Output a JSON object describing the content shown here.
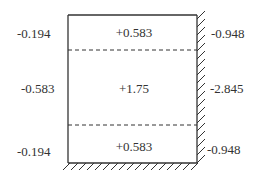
{
  "diagram": {
    "type": "structural-section-moment-distribution",
    "zones": [
      {
        "id": "top",
        "inner_value": "+0.583",
        "left_value": "-0.194",
        "right_value": "-0.948"
      },
      {
        "id": "middle",
        "inner_value": "+1.75",
        "left_value": "-0.583",
        "right_value": "-2.845"
      },
      {
        "id": "bottom",
        "inner_value": "+0.583",
        "left_value": "-0.194",
        "right_value": "-0.948"
      }
    ],
    "supports": {
      "right": "fixed",
      "bottom": "fixed"
    },
    "colors": {
      "line": "#333333",
      "text": "#333333",
      "background": "#ffffff"
    }
  }
}
